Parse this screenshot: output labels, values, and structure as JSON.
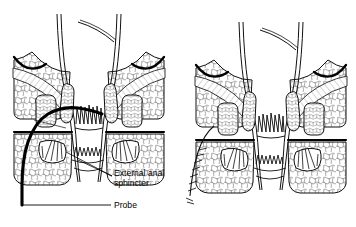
{
  "figure": {
    "type": "medical-line-drawing",
    "background_color": "#ffffff",
    "line_color": "#000000",
    "panel_count": 2
  },
  "labels": {
    "external_anal_sphincter": "External anal\nsphincter",
    "external_anal_sphincter_line1": "External anal",
    "external_anal_sphincter_line2": "sphincter",
    "probe": "Probe"
  },
  "panels": [
    {
      "name": "left-panel",
      "description": "Anal canal cross-section with probe inserted through fistula tract",
      "has_probe": true,
      "has_labels": true
    },
    {
      "name": "right-panel",
      "description": "Anal canal cross-section after repair, probe removed",
      "has_probe": false,
      "has_labels": false
    }
  ],
  "structures": [
    "rectal-wall",
    "levator-ani-muscle",
    "internal-anal-sphincter",
    "external-anal-sphincter",
    "ischiorectal-fat",
    "anal-mucosa-columns",
    "intersphincteric-groove"
  ]
}
